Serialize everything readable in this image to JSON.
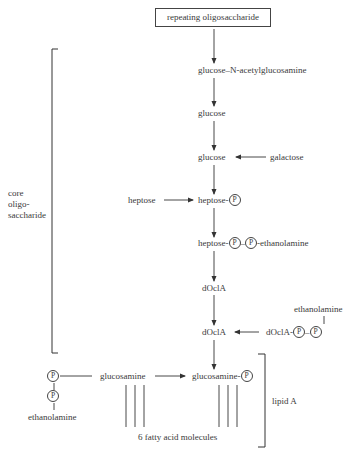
{
  "title_box": "repeating oligosaccharide",
  "nodes": {
    "glcnac": "glucose–N-acetylglucosamine",
    "glucose1": "glucose",
    "glucose2": "glucose",
    "galactose": "galactose",
    "heptose_in": "heptose",
    "heptose_p": "heptose-",
    "heptose_pp": "heptose-",
    "heptose_pp_tail": "-ethanolamine",
    "docla1": "dOclA",
    "docla2": "dOclA",
    "docla_pp": "dOclA-",
    "ethanolamine_top": "ethanolamine",
    "glucosamine_left": "glucosamine",
    "glucosamine_right": "glucosamine-",
    "ethanolamine_bottom": "ethanolamine",
    "fatty_acids": "6 fatty acid molecules"
  },
  "phosphate_symbol": "P",
  "dash": "–",
  "brackets": {
    "core_line1": "core",
    "core_line2": "oligo-",
    "core_line3": "saccharide",
    "lipid_a": "lipid A"
  }
}
